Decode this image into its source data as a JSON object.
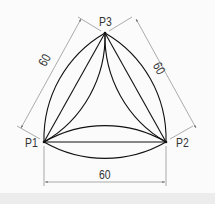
{
  "diagram": {
    "type": "geometry-construction",
    "points": [
      {
        "id": "P1",
        "label": "P1",
        "x": 44,
        "y": 142
      },
      {
        "id": "P2",
        "label": "P2",
        "x": 166,
        "y": 142
      },
      {
        "id": "P3",
        "label": "P3",
        "x": 105,
        "y": 33
      }
    ],
    "dimensions": [
      {
        "id": "left",
        "label": "60",
        "from": "P1",
        "to": "P3"
      },
      {
        "id": "right",
        "label": "60",
        "from": "P3",
        "to": "P2"
      },
      {
        "id": "bottom",
        "label": "60",
        "from": "P1",
        "to": "P2"
      }
    ],
    "colors": {
      "stroke": "#111111",
      "dimension": "#777777",
      "background": "#fbfbfb",
      "band": "#ececec"
    }
  }
}
